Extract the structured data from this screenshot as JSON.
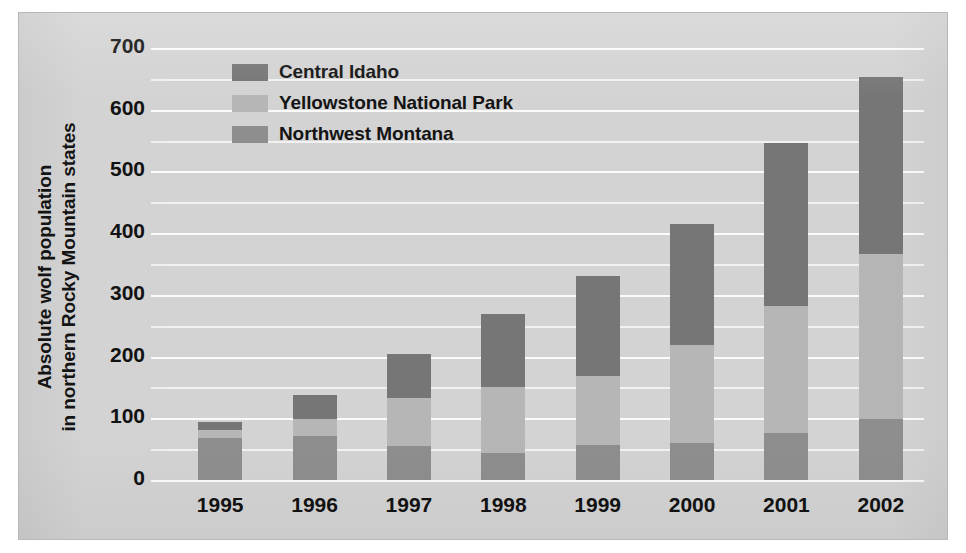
{
  "chart_data": {
    "type": "bar",
    "subtype": "stacked-bar",
    "title": "",
    "xlabel": "",
    "ylabel": "Absolute wolf population in northern Rocky Mountain states",
    "ylabel_lines": [
      "Absolute wolf population",
      "in northern Rocky Mountain states"
    ],
    "categories": [
      "1995",
      "1996",
      "1997",
      "1998",
      "1999",
      "2000",
      "2001",
      "2002"
    ],
    "series": [
      {
        "name": "Central Idaho",
        "color": "#767676",
        "values": [
          14,
          40,
          71,
          117,
          163,
          197,
          264,
          286
        ]
      },
      {
        "name": "Yellowstone National Park",
        "color": "#b6b6b6",
        "values": [
          13,
          27,
          78,
          108,
          112,
          158,
          207,
          267
        ]
      },
      {
        "name": "Northwest Montana",
        "color": "#8e8e8e",
        "values": [
          69,
          73,
          57,
          45,
          58,
          62,
          77,
          101
        ]
      }
    ],
    "totals": [
      96,
      140,
      206,
      270,
      333,
      417,
      548,
      654
    ],
    "ylim": [
      0,
      700
    ],
    "ytick_values": [
      0,
      100,
      200,
      300,
      400,
      500,
      600,
      700
    ],
    "ytick_labels": [
      "0",
      "100",
      "200",
      "300",
      "400",
      "500",
      "600",
      "700"
    ],
    "yminor_step": 50,
    "grid": true,
    "grid_color": "#fbfbfb",
    "legend_position": "top-left-inside",
    "legend_entries": [
      "Central Idaho",
      "Yellowstone National Park",
      "Northwest Montana"
    ],
    "background_color": "#d3d3d3"
  }
}
